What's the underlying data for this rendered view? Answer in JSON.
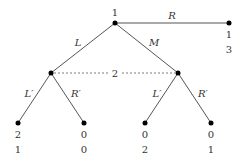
{
  "diagram": {
    "type": "extensive-form game tree",
    "root": {
      "player": "1",
      "x": 115,
      "y": 23
    },
    "nodes": [
      {
        "id": "root",
        "x": 115,
        "y": 23,
        "player": "1"
      },
      {
        "id": "n_L",
        "x": 51,
        "y": 73
      },
      {
        "id": "n_M",
        "x": 178,
        "y": 73
      },
      {
        "id": "t_R",
        "x": 229,
        "y": 23,
        "payoffs": [
          "1",
          "3"
        ]
      },
      {
        "id": "t_LL",
        "x": 18,
        "y": 123,
        "payoffs": [
          "2",
          "1"
        ]
      },
      {
        "id": "t_LR",
        "x": 84,
        "y": 123,
        "payoffs": [
          "0",
          "0"
        ]
      },
      {
        "id": "t_ML",
        "x": 145,
        "y": 123,
        "payoffs": [
          "0",
          "2"
        ]
      },
      {
        "id": "t_MR",
        "x": 211,
        "y": 123,
        "payoffs": [
          "0",
          "1"
        ]
      }
    ],
    "edges": [
      {
        "from": "root",
        "to": "n_L",
        "label": "L"
      },
      {
        "from": "root",
        "to": "n_M",
        "label": "M"
      },
      {
        "from": "root",
        "to": "t_R",
        "label": "R"
      },
      {
        "from": "n_L",
        "to": "t_LL",
        "label": "L′"
      },
      {
        "from": "n_L",
        "to": "t_LR",
        "label": "R′"
      },
      {
        "from": "n_M",
        "to": "t_ML",
        "label": "L′"
      },
      {
        "from": "n_M",
        "to": "t_MR",
        "label": "R′"
      }
    ],
    "information_set": {
      "player": "2",
      "nodes": [
        "n_L",
        "n_M"
      ]
    },
    "labels": {
      "root_player": "1",
      "info_set_player": "2",
      "a_L": "L",
      "a_M": "M",
      "a_R": "R",
      "a_LL": "L′",
      "a_LR": "R′",
      "a_ML": "L′",
      "a_MR": "R′",
      "pay_R_1": "1",
      "pay_R_2": "3",
      "pay_LL_1": "2",
      "pay_LL_2": "1",
      "pay_LR_1": "0",
      "pay_LR_2": "0",
      "pay_ML_1": "0",
      "pay_ML_2": "2",
      "pay_MR_1": "0",
      "pay_MR_2": "1"
    }
  }
}
